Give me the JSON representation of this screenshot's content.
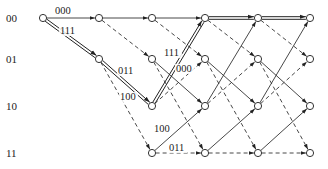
{
  "diagram": {
    "type": "trellis",
    "states": [
      "00",
      "01",
      "10",
      "11"
    ],
    "columns_x": [
      43,
      99,
      152,
      205,
      258,
      310
    ],
    "rows_y": [
      18,
      59,
      106,
      153
    ],
    "state_label_x": 6,
    "legend": {
      "solid": "input 0",
      "dashed": "input 1"
    },
    "transitions": [
      {
        "from": "00",
        "to": "00",
        "style": "solid",
        "output": "000"
      },
      {
        "from": "00",
        "to": "01",
        "style": "dashed",
        "output": "111"
      },
      {
        "from": "01",
        "to": "10",
        "style": "solid",
        "output": "011"
      },
      {
        "from": "01",
        "to": "11",
        "style": "dashed",
        "output": "100"
      },
      {
        "from": "10",
        "to": "00",
        "style": "solid",
        "output": "111"
      },
      {
        "from": "10",
        "to": "01",
        "style": "dashed",
        "output": "000"
      },
      {
        "from": "11",
        "to": "10",
        "style": "solid",
        "output": "100"
      },
      {
        "from": "11",
        "to": "11",
        "style": "dashed",
        "output": "011"
      }
    ],
    "survivor_path": [
      "00",
      "01",
      "10",
      "00",
      "00",
      "00"
    ],
    "edge_labels": [
      {
        "text": "000",
        "x": 55,
        "y": 14
      },
      {
        "text": "111",
        "x": 60,
        "y": 34
      },
      {
        "text": "011",
        "x": 118,
        "y": 74
      },
      {
        "text": "100",
        "x": 120,
        "y": 100
      },
      {
        "text": "111",
        "x": 164,
        "y": 56
      },
      {
        "text": "000",
        "x": 176,
        "y": 72
      },
      {
        "text": "100",
        "x": 154,
        "y": 132
      },
      {
        "text": "011",
        "x": 169,
        "y": 151
      }
    ]
  }
}
